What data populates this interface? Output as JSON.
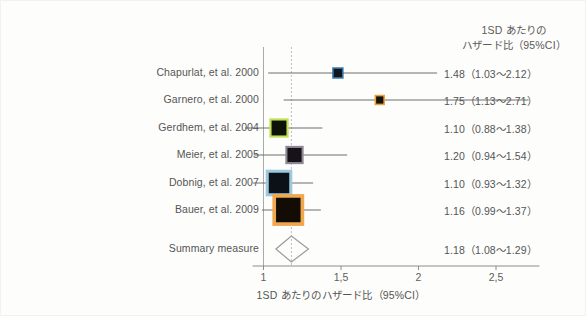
{
  "figure": {
    "column_header_line1": "1SD あたりの",
    "column_header_line2": "ハザード比（95%CI）",
    "axis_title": "1SD あたりのハザード比（95%CI）"
  },
  "chart_data": {
    "type": "forest",
    "title": "",
    "xlabel": "1SD あたりのハザード比（95%CI）",
    "ylabel": "",
    "xlim": [
      0.93,
      2.78
    ],
    "xticks": [
      1,
      1.5,
      2,
      2.5
    ],
    "xtick_labels": [
      "1",
      "1,5",
      "2",
      "2,5"
    ],
    "grid": false,
    "reference_line": 1.0,
    "pooled_line": 1.18,
    "effect_measure": "Hazard ratio per 1SD",
    "studies": [
      {
        "label": "Chapurlat, et al. 2000",
        "estimate": 1.48,
        "ci_low": 1.03,
        "ci_high": 2.12,
        "value_text": "1.48（1.03〜2.12）",
        "weight": 0.06,
        "marker_border_color": "#2e6fa8",
        "marker_fill_color": "#12161c"
      },
      {
        "label": "Garnero, et al. 2000",
        "estimate": 1.75,
        "ci_low": 1.13,
        "ci_high": 2.71,
        "value_text": "1.75（1.13〜2.71）",
        "weight": 0.04,
        "marker_border_color": "#e8a33d",
        "marker_fill_color": "#1a1206"
      },
      {
        "label": "Gerdhem, et al. 2004",
        "estimate": 1.1,
        "ci_low": 0.88,
        "ci_high": 1.38,
        "value_text": "1.10（0.88〜1.38）",
        "weight": 0.22,
        "marker_border_color": "#c3e05a",
        "marker_fill_color": "#0d1405"
      },
      {
        "label": "Meier, et al.  2005",
        "estimate": 1.2,
        "ci_low": 0.94,
        "ci_high": 1.54,
        "value_text": "1.20（0.94〜1.54）",
        "weight": 0.2,
        "marker_border_color": "#8e8796",
        "marker_fill_color": "#16121a"
      },
      {
        "label": "Dobnig, et al. 2007",
        "estimate": 1.1,
        "ci_low": 0.93,
        "ci_high": 1.32,
        "value_text": "1.10（0.93〜1.32）",
        "weight": 0.36,
        "marker_border_color": "#9ec8de",
        "marker_fill_color": "#0b1116"
      },
      {
        "label": "Bauer, et al. 2009",
        "estimate": 1.16,
        "ci_low": 0.99,
        "ci_high": 1.37,
        "value_text": "1.16（0.99〜1.37）",
        "weight": 0.46,
        "marker_border_color": "#efa84e",
        "marker_fill_color": "#120c04"
      }
    ],
    "summary": {
      "label": "Summary measure",
      "estimate": 1.18,
      "ci_low": 1.08,
      "ci_high": 1.29,
      "value_text": "1.18（1.08〜1.29）",
      "marker_color": "#9b9b9b"
    }
  }
}
